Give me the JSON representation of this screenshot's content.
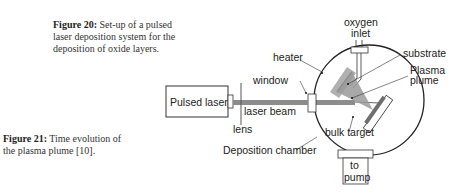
{
  "figure20": {
    "label": "Figure 20:",
    "text": " Set-up of a pulsed laser deposition system for the deposition of oxide layers."
  },
  "figure21": {
    "label": "Figure 21:",
    "text": " Time evolution of the plasma plume [10]."
  },
  "diagram": {
    "labels": {
      "pulsed_laser": "Pulsed laser",
      "lens": "lens",
      "laser_beam": "laser beam",
      "window": "window",
      "heater": "heater",
      "oxygen_line1": "oxygen",
      "oxygen_line2": "inlet",
      "substrate": "substrate",
      "plasma_line1": "Plasma",
      "plasma_line2": "plume",
      "bulk_target": "bulk target",
      "deposition_chamber": "Deposition chamber",
      "pump_line1": "to",
      "pump_line2": "pump"
    },
    "colors": {
      "line": "#222222",
      "beam": "#8c8c8c",
      "heater": "#b0b0b0",
      "plume": "#9a9a9a",
      "target": "#6e6e6e"
    }
  }
}
